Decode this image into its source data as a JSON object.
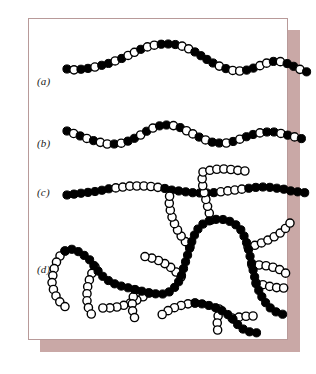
{
  "figure": {
    "background_color": "#ffffff",
    "plate_color": "#ffffff",
    "border_color": "#b89a99",
    "shadow_color": "#c9a8a6",
    "bead_black_color": "#000000",
    "bead_white_color": "#ffffff",
    "bead_outline_color": "#000000",
    "bead_radius": 4.1
  },
  "rows": [
    {
      "id": "row-a",
      "label": "(a)",
      "name": "random-copolymer",
      "label_x": 8,
      "label_y": 44,
      "sequence": [
        1,
        0,
        1,
        1,
        0,
        1,
        1,
        0,
        1,
        0,
        0,
        1,
        0,
        0,
        1,
        1,
        1,
        0,
        0,
        1,
        1,
        1,
        1,
        0,
        1,
        0,
        0,
        1,
        1,
        0,
        0
      ],
      "path": [
        [
          38,
          50
        ],
        [
          46,
          51
        ],
        [
          54,
          50
        ],
        [
          62,
          49
        ],
        [
          70,
          47
        ],
        [
          78,
          45
        ],
        [
          86,
          42
        ],
        [
          94,
          39
        ],
        [
          102,
          35
        ],
        [
          110,
          31
        ],
        [
          118,
          28
        ],
        [
          126,
          26
        ],
        [
          134,
          25
        ],
        [
          142,
          25
        ],
        [
          150,
          26
        ],
        [
          158,
          29
        ],
        [
          166,
          33
        ],
        [
          174,
          38
        ],
        [
          182,
          43
        ],
        [
          190,
          47
        ],
        [
          198,
          50
        ],
        [
          206,
          52
        ],
        [
          214,
          52
        ],
        [
          222,
          50
        ],
        [
          230,
          47
        ],
        [
          238,
          44
        ],
        [
          246,
          42
        ],
        [
          254,
          43
        ],
        [
          262,
          46
        ],
        [
          270,
          50
        ],
        [
          278,
          53
        ]
      ]
    },
    {
      "id": "row-b",
      "label": "(b)",
      "name": "statistical-copolymer",
      "label_x": 8,
      "label_y": 110,
      "sequence": [
        1,
        0,
        1,
        0,
        1,
        0,
        0,
        1,
        0,
        1,
        1,
        0,
        1,
        0,
        1,
        1,
        0,
        1,
        0,
        0,
        1,
        0,
        1,
        1,
        0,
        1,
        0,
        1,
        1,
        0,
        1
      ],
      "path": [
        [
          38,
          112
        ],
        [
          46,
          115
        ],
        [
          54,
          118
        ],
        [
          62,
          121
        ],
        [
          70,
          123
        ],
        [
          78,
          125
        ],
        [
          86,
          125
        ],
        [
          94,
          124
        ],
        [
          102,
          121
        ],
        [
          110,
          117
        ],
        [
          118,
          112
        ],
        [
          126,
          108
        ],
        [
          134,
          106
        ],
        [
          142,
          106
        ],
        [
          150,
          108
        ],
        [
          158,
          112
        ],
        [
          166,
          116
        ],
        [
          174,
          120
        ],
        [
          182,
          123
        ],
        [
          190,
          124
        ],
        [
          198,
          124
        ],
        [
          206,
          122
        ],
        [
          214,
          119
        ],
        [
          222,
          116
        ],
        [
          230,
          114
        ],
        [
          238,
          113
        ],
        [
          246,
          113
        ],
        [
          254,
          115
        ],
        [
          262,
          117
        ],
        [
          270,
          119
        ],
        [
          278,
          121
        ]
      ]
    },
    {
      "id": "row-c",
      "label": "(c)",
      "name": "block-copolymer",
      "label_x": 8,
      "label_y": 172,
      "sequence": [
        1,
        1,
        1,
        1,
        1,
        1,
        1,
        0,
        0,
        0,
        0,
        0,
        0,
        0,
        1,
        1,
        1,
        1,
        1,
        1,
        1,
        1,
        0,
        0,
        0,
        0,
        1,
        1,
        1,
        1,
        1
      ],
      "path": [
        [
          38,
          176
        ],
        [
          46,
          175
        ],
        [
          54,
          174
        ],
        [
          62,
          173
        ],
        [
          70,
          172
        ],
        [
          78,
          170
        ],
        [
          86,
          169
        ],
        [
          94,
          168
        ],
        [
          102,
          167
        ],
        [
          110,
          167
        ],
        [
          118,
          167
        ],
        [
          126,
          168
        ],
        [
          134,
          169
        ],
        [
          142,
          171
        ],
        [
          150,
          172
        ],
        [
          158,
          173
        ],
        [
          166,
          174
        ],
        [
          174,
          174
        ],
        [
          182,
          174
        ],
        [
          190,
          173
        ],
        [
          198,
          172
        ],
        [
          206,
          171
        ],
        [
          214,
          170
        ],
        [
          222,
          169
        ],
        [
          230,
          168
        ],
        [
          238,
          168
        ],
        [
          246,
          169
        ],
        [
          254,
          170
        ],
        [
          262,
          172
        ],
        [
          270,
          173
        ],
        [
          278,
          174
        ]
      ]
    },
    {
      "id": "row-d",
      "label": "(d)",
      "name": "graft-copolymer",
      "label_x": 8,
      "label_y": 248
    }
  ],
  "graft": {
    "backbone_name": "graft-backbone",
    "backbone_color": "#000000",
    "backbone": [
      [
        36,
        232
      ],
      [
        44,
        230
      ],
      [
        52,
        234
      ],
      [
        60,
        240
      ],
      [
        66,
        248
      ],
      [
        72,
        256
      ],
      [
        80,
        262
      ],
      [
        88,
        266
      ],
      [
        96,
        268
      ],
      [
        104,
        270
      ],
      [
        112,
        272
      ],
      [
        120,
        274
      ],
      [
        128,
        275
      ],
      [
        136,
        275
      ],
      [
        142,
        272
      ],
      [
        148,
        266
      ],
      [
        152,
        258
      ],
      [
        155,
        248
      ],
      [
        158,
        238
      ],
      [
        161,
        228
      ],
      [
        164,
        219
      ],
      [
        168,
        211
      ],
      [
        174,
        205
      ],
      [
        182,
        201
      ],
      [
        190,
        200
      ],
      [
        198,
        201
      ],
      [
        206,
        205
      ],
      [
        212,
        211
      ],
      [
        216,
        219
      ],
      [
        219,
        228
      ],
      [
        221,
        237
      ],
      [
        223,
        246
      ],
      [
        225,
        255
      ],
      [
        227,
        264
      ],
      [
        230,
        272
      ],
      [
        234,
        280
      ],
      [
        239,
        287
      ],
      [
        245,
        292
      ],
      [
        252,
        295
      ],
      [
        259,
        296
      ]
    ],
    "side_chains": [
      {
        "name": "graft-side-chain-1",
        "points": [
          [
            36,
            232
          ],
          [
            30,
            238
          ],
          [
            26,
            246
          ],
          [
            24,
            255
          ],
          [
            23,
            264
          ],
          [
            25,
            273
          ],
          [
            29,
            281
          ],
          [
            35,
            287
          ],
          [
            42,
            291
          ]
        ]
      },
      {
        "name": "graft-side-chain-2",
        "points": [
          [
            66,
            248
          ],
          [
            62,
            256
          ],
          [
            59,
            265
          ],
          [
            58,
            274
          ],
          [
            58,
            283
          ],
          [
            60,
            291
          ],
          [
            64,
            298
          ]
        ]
      },
      {
        "name": "graft-side-chain-3",
        "points": [
          [
            120,
            274
          ],
          [
            112,
            279
          ],
          [
            104,
            283
          ],
          [
            96,
            286
          ],
          [
            88,
            288
          ],
          [
            80,
            289
          ],
          [
            72,
            289
          ]
        ]
      },
      {
        "name": "graft-side-chain-4",
        "points": [
          [
            152,
            258
          ],
          [
            146,
            252
          ],
          [
            140,
            247
          ],
          [
            133,
            243
          ],
          [
            126,
            240
          ],
          [
            119,
            238
          ],
          [
            112,
            237
          ]
        ]
      },
      {
        "name": "graft-side-chain-5",
        "points": [
          [
            161,
            228
          ],
          [
            155,
            221
          ],
          [
            150,
            214
          ],
          [
            146,
            206
          ],
          [
            143,
            198
          ],
          [
            141,
            190
          ],
          [
            140,
            182
          ],
          [
            141,
            174
          ]
        ]
      },
      {
        "name": "graft-side-chain-6",
        "points": [
          [
            182,
            201
          ],
          [
            180,
            193
          ],
          [
            178,
            185
          ],
          [
            176,
            177
          ],
          [
            174,
            169
          ],
          [
            173,
            161
          ],
          [
            174,
            153
          ]
        ]
      },
      {
        "name": "graft-side-chain-7",
        "points": [
          [
            174,
            153
          ],
          [
            182,
            151
          ],
          [
            190,
            150
          ],
          [
            198,
            150
          ],
          [
            206,
            151
          ],
          [
            214,
            152
          ],
          [
            222,
            152
          ]
        ]
      },
      {
        "name": "graft-side-chain-8",
        "points": [
          [
            219,
            228
          ],
          [
            227,
            226
          ],
          [
            235,
            223
          ],
          [
            243,
            219
          ],
          [
            250,
            215
          ],
          [
            256,
            210
          ],
          [
            261,
            204
          ]
        ]
      },
      {
        "name": "graft-side-chain-9",
        "points": [
          [
            223,
            246
          ],
          [
            231,
            246
          ],
          [
            239,
            247
          ],
          [
            247,
            249
          ],
          [
            254,
            252
          ],
          [
            260,
            257
          ]
        ]
      },
      {
        "name": "graft-side-chain-10",
        "points": [
          [
            227,
            264
          ],
          [
            235,
            266
          ],
          [
            243,
            268
          ],
          [
            251,
            269
          ],
          [
            259,
            269
          ]
        ]
      },
      {
        "name": "graft-side-chain-11",
        "points": [
          [
            106,
            271
          ],
          [
            104,
            279
          ],
          [
            103,
            287
          ],
          [
            104,
            295
          ],
          [
            107,
            302
          ]
        ]
      }
    ],
    "secondary_backbone": {
      "name": "graft-backbone-secondary",
      "color": "#000000",
      "points": [
        [
          166,
          284
        ],
        [
          174,
          285
        ],
        [
          182,
          287
        ],
        [
          190,
          290
        ],
        [
          197,
          294
        ],
        [
          203,
          299
        ],
        [
          208,
          305
        ],
        [
          214,
          310
        ],
        [
          221,
          313
        ],
        [
          229,
          314
        ]
      ]
    },
    "secondary_side_chains": [
      {
        "name": "graft-secondary-side-chain-1",
        "points": [
          [
            166,
            284
          ],
          [
            158,
            285
          ],
          [
            150,
            287
          ],
          [
            142,
            290
          ],
          [
            135,
            294
          ],
          [
            129,
            299
          ]
        ]
      },
      {
        "name": "graft-secondary-side-chain-2",
        "points": [
          [
            190,
            290
          ],
          [
            189,
            298
          ],
          [
            188,
            306
          ],
          [
            189,
            314
          ]
        ]
      },
      {
        "name": "graft-secondary-side-chain-3",
        "points": [
          [
            203,
            299
          ],
          [
            211,
            298
          ],
          [
            219,
            297
          ],
          [
            227,
            297
          ]
        ]
      }
    ]
  }
}
